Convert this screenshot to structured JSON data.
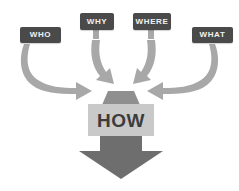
{
  "diagram": {
    "background_color": "#ffffff",
    "colors": {
      "box_fill": "#4a4a4a",
      "box_text": "#f2f2f2",
      "curved_arrow": "#a8a8a8",
      "shaft": "#8f8f8f",
      "main_arrow": "#6e6e6e",
      "how_band": "#c9c9c9",
      "how_text": "#3c3c3c"
    },
    "question_boxes": [
      {
        "id": "who",
        "label": "WHO"
      },
      {
        "id": "why",
        "label": "WHY"
      },
      {
        "id": "where",
        "label": "WHERE"
      },
      {
        "id": "what",
        "label": "WHAT"
      }
    ],
    "center": {
      "label": "HOW"
    },
    "arrows": [
      {
        "id": "who-arrow",
        "from": "WHO",
        "to": "HOW",
        "direction": "curve-right"
      },
      {
        "id": "why-arrow",
        "from": "WHY",
        "to": "HOW",
        "direction": "curve-down-right"
      },
      {
        "id": "where-arrow",
        "from": "WHERE",
        "to": "HOW",
        "direction": "curve-down-left"
      },
      {
        "id": "what-arrow",
        "from": "WHAT",
        "to": "HOW",
        "direction": "curve-left"
      },
      {
        "id": "output-arrow",
        "from": "HOW",
        "to": "",
        "direction": "down"
      }
    ]
  }
}
